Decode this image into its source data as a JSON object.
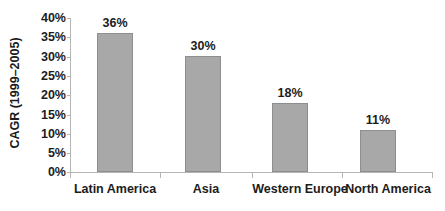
{
  "chart_data": {
    "type": "bar",
    "title": "",
    "subtitle": "",
    "xlabel": "",
    "ylabel": "CAGR (1999–2005)",
    "categories": [
      "Latin America",
      "Asia",
      "Western Europe",
      "North America"
    ],
    "values": [
      36,
      30,
      18,
      11
    ],
    "value_labels": [
      "36%",
      "30%",
      "18%",
      "11%"
    ],
    "ylim": [
      0,
      40
    ],
    "ytick_values": [
      0,
      5,
      10,
      15,
      20,
      25,
      30,
      35,
      40
    ],
    "ytick_labels": [
      "0%",
      "5%",
      "10%",
      "15%",
      "20%",
      "25%",
      "30%",
      "35%",
      "40%"
    ],
    "grid": false,
    "legend": null,
    "legend_position": "none",
    "series": [
      {
        "name": "CAGR",
        "values": [
          36,
          30,
          18,
          11
        ]
      }
    ],
    "colors": {
      "bar_fill": "#a8a8a8",
      "bar_border": "#8e8e8e",
      "axis_line": "#b5b5b5",
      "text": "#1c1c1c",
      "background": "#ffffff"
    }
  }
}
